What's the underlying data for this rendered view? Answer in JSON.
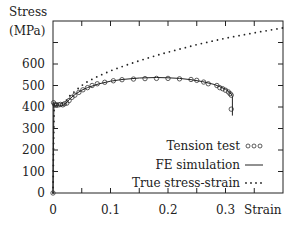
{
  "chart_data": {
    "type": "line",
    "title": "",
    "xlabel": "Strain",
    "ylabel": "Stress (MPa)",
    "ylabel_lines": [
      "Stress",
      "(MPa)"
    ],
    "xlim": [
      0,
      0.4
    ],
    "ylim": [
      0,
      800
    ],
    "x_ticks": [
      0,
      0.05,
      0.1,
      0.15,
      0.2,
      0.25,
      0.3,
      0.35
    ],
    "x_tick_labels": [
      "0",
      "0.1",
      "0.2",
      "0.3"
    ],
    "x_tick_label_values": [
      0,
      0.1,
      0.2,
      0.3
    ],
    "y_ticks": [
      0,
      100,
      200,
      300,
      400,
      500,
      600,
      700
    ],
    "y_tick_labels": [
      "0",
      "100",
      "200",
      "300",
      "400",
      "500",
      "600"
    ],
    "y_tick_label_values": [
      0,
      100,
      200,
      300,
      400,
      500,
      600
    ],
    "grid": false,
    "legend_position": "lower right",
    "series": [
      {
        "name": "Tension test",
        "style": "circles",
        "x": [
          0,
          0.001,
          0.003,
          0.006,
          0.01,
          0.013,
          0.017,
          0.02,
          0.024,
          0.028,
          0.033,
          0.038,
          0.045,
          0.052,
          0.06,
          0.068,
          0.077,
          0.09,
          0.105,
          0.12,
          0.14,
          0.16,
          0.18,
          0.2,
          0.22,
          0.24,
          0.25,
          0.262,
          0.27,
          0.285,
          0.29,
          0.295,
          0.3,
          0.305,
          0.308,
          0.31,
          0.31
        ],
        "y": [
          0,
          420,
          412,
          410,
          410,
          412,
          410,
          415,
          418,
          430,
          445,
          455,
          468,
          480,
          490,
          500,
          508,
          515,
          522,
          527,
          530,
          532,
          533,
          533,
          531,
          528,
          524,
          516,
          508,
          500,
          490,
          485,
          478,
          470,
          462,
          455,
          390
        ]
      },
      {
        "name": "FE simulation",
        "style": "solid",
        "x": [
          0,
          0.0015,
          0.003,
          0.005,
          0.01,
          0.015,
          0.02,
          0.025,
          0.03,
          0.04,
          0.05,
          0.06,
          0.08,
          0.1,
          0.12,
          0.15,
          0.18,
          0.2,
          0.22,
          0.24,
          0.26,
          0.28,
          0.29,
          0.3,
          0.305,
          0.31,
          0.312,
          0.312
        ],
        "y": [
          0,
          420,
          410,
          405,
          410,
          405,
          412,
          425,
          440,
          462,
          478,
          490,
          508,
          520,
          528,
          535,
          537,
          536,
          533,
          527,
          518,
          505,
          495,
          483,
          474,
          460,
          450,
          360
        ]
      },
      {
        "name": "True stress-strain",
        "style": "dotted",
        "x": [
          0,
          0.002,
          0.01,
          0.02,
          0.03,
          0.04,
          0.05,
          0.06,
          0.08,
          0.1,
          0.12,
          0.15,
          0.18,
          0.2,
          0.25,
          0.3,
          0.35,
          0.4
        ],
        "y": [
          0,
          420,
          412,
          420,
          455,
          478,
          500,
          518,
          545,
          568,
          588,
          615,
          640,
          655,
          690,
          720,
          745,
          768
        ]
      }
    ]
  }
}
